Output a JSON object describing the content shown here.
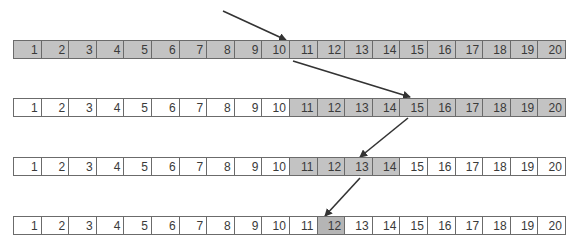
{
  "diagram": {
    "type": "binary-search-illustration",
    "colors": {
      "highlight": "#c3c3c3",
      "target": "#b5b5b5",
      "border": "#6b6b6b",
      "arrow": "#333333"
    },
    "rows": [
      {
        "cells": [
          "1",
          "2",
          "3",
          "4",
          "5",
          "6",
          "7",
          "8",
          "9",
          "10",
          "11",
          "12",
          "13",
          "14",
          "15",
          "16",
          "17",
          "18",
          "19",
          "20"
        ],
        "highlight_range": [
          1,
          20
        ],
        "pointer": 10
      },
      {
        "cells": [
          "1",
          "2",
          "3",
          "4",
          "5",
          "6",
          "7",
          "8",
          "9",
          "10",
          "11",
          "12",
          "13",
          "14",
          "15",
          "16",
          "17",
          "18",
          "19",
          "20"
        ],
        "highlight_range": [
          11,
          20
        ],
        "pointer": 15
      },
      {
        "cells": [
          "1",
          "2",
          "3",
          "4",
          "5",
          "6",
          "7",
          "8",
          "9",
          "10",
          "11",
          "12",
          "13",
          "14",
          "15",
          "16",
          "17",
          "18",
          "19",
          "20"
        ],
        "highlight_range": [
          11,
          14
        ],
        "pointer": 13
      },
      {
        "cells": [
          "1",
          "2",
          "3",
          "4",
          "5",
          "6",
          "7",
          "8",
          "9",
          "10",
          "11",
          "12",
          "13",
          "14",
          "15",
          "16",
          "17",
          "18",
          "19",
          "20"
        ],
        "highlight_range": [
          12,
          12
        ],
        "pointer": 12
      }
    ]
  }
}
